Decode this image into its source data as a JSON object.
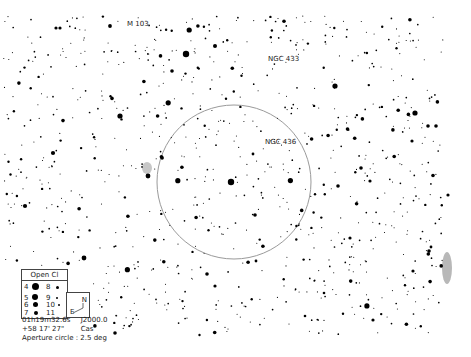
{
  "chart": {
    "background": "#ffffff",
    "star_color": "#000000",
    "aperture_circle": {
      "cx": 234,
      "cy": 182,
      "r": 77,
      "color": "#9a9a9a"
    }
  },
  "labels": {
    "m103": "M 103",
    "ngc433": "NGC 433",
    "ngc436": "NGC 436"
  },
  "legend": {
    "title": "Open Cl",
    "magnitudes": [
      {
        "mag": "4",
        "size": 7
      },
      {
        "mag": "5",
        "size": 6
      },
      {
        "mag": "6",
        "size": 5
      },
      {
        "mag": "7",
        "size": 4
      },
      {
        "mag": "8",
        "size": 3
      },
      {
        "mag": "9",
        "size": 2.5
      },
      {
        "mag": "10",
        "size": 2
      },
      {
        "mag": "11",
        "size": 1.5
      }
    ]
  },
  "compass": {
    "north": "N",
    "east": "E"
  },
  "info": {
    "ra": "01h19m32.6s",
    "epoch": "J2000.0",
    "dec": "+58 17' 27\"",
    "constellation": "Cas",
    "aperture": "Aperture circle : 2.5 deg"
  }
}
